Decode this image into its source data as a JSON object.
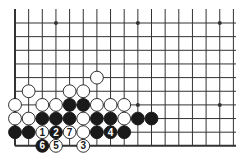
{
  "diagram": {
    "type": "go-board-corner",
    "grid": {
      "origin_x": 15,
      "origin_y": 23,
      "spacing": 13.65,
      "cols": 17,
      "rows": 10,
      "top_extend": 9,
      "right_extend": 236
    },
    "colors": {
      "line": "#333333",
      "black_stone": "#1a1a1a",
      "white_stone": "#ffffff",
      "stone_border": "#1a1a1a"
    },
    "star_points": [
      {
        "col": 3,
        "row": 0
      },
      {
        "col": 9,
        "row": 0
      },
      {
        "col": 15,
        "row": 0
      },
      {
        "col": 9,
        "row": 6
      },
      {
        "col": 15,
        "row": 6
      }
    ],
    "stones": [
      {
        "col": 6,
        "row": 4,
        "color": "white"
      },
      {
        "col": 1,
        "row": 5,
        "color": "white"
      },
      {
        "col": 4,
        "row": 5,
        "color": "white"
      },
      {
        "col": 5,
        "row": 5,
        "color": "white"
      },
      {
        "col": 0,
        "row": 6,
        "color": "white"
      },
      {
        "col": 2,
        "row": 6,
        "color": "white"
      },
      {
        "col": 3,
        "row": 6,
        "color": "white"
      },
      {
        "col": 4,
        "row": 6,
        "color": "black"
      },
      {
        "col": 5,
        "row": 6,
        "color": "black"
      },
      {
        "col": 6,
        "row": 6,
        "color": "white"
      },
      {
        "col": 7,
        "row": 6,
        "color": "white"
      },
      {
        "col": 8,
        "row": 6,
        "color": "white"
      },
      {
        "col": 0,
        "row": 7,
        "color": "white"
      },
      {
        "col": 1,
        "row": 7,
        "color": "white"
      },
      {
        "col": 2,
        "row": 7,
        "color": "black"
      },
      {
        "col": 3,
        "row": 7,
        "color": "black"
      },
      {
        "col": 4,
        "row": 7,
        "color": "black"
      },
      {
        "col": 5,
        "row": 7,
        "color": "white"
      },
      {
        "col": 6,
        "row": 7,
        "color": "black"
      },
      {
        "col": 7,
        "row": 7,
        "color": "black"
      },
      {
        "col": 8,
        "row": 7,
        "color": "white"
      },
      {
        "col": 9,
        "row": 7,
        "color": "black"
      },
      {
        "col": 10,
        "row": 7,
        "color": "black"
      },
      {
        "col": 0,
        "row": 8,
        "color": "black"
      },
      {
        "col": 1,
        "row": 8,
        "color": "black"
      },
      {
        "col": 2,
        "row": 8,
        "color": "white",
        "label": "1"
      },
      {
        "col": 3,
        "row": 8,
        "color": "black",
        "label": "2"
      },
      {
        "col": 4,
        "row": 8,
        "color": "white",
        "label": "7"
      },
      {
        "col": 5,
        "row": 8,
        "color": "white"
      },
      {
        "col": 6,
        "row": 8,
        "color": "black"
      },
      {
        "col": 7,
        "row": 8,
        "color": "black",
        "label": "4"
      },
      {
        "col": 8,
        "row": 8,
        "color": "black"
      },
      {
        "col": 2,
        "row": 9,
        "color": "black",
        "label": "6"
      },
      {
        "col": 3,
        "row": 9,
        "color": "white",
        "label": "5"
      },
      {
        "col": 5,
        "row": 9,
        "color": "white",
        "label": "3"
      }
    ]
  }
}
